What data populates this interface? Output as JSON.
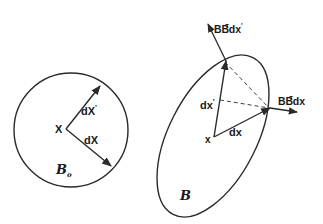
{
  "diagram": {
    "reference": {
      "region_label": "B",
      "region_subscript": "o",
      "point_label": "X",
      "vector_1_label": "dX",
      "vector_2_label": "dX",
      "vector_2_prime": "'"
    },
    "deformed": {
      "region_label": "B",
      "point_label": "x",
      "vector_1_label": "dx",
      "vector_2_label": "dx",
      "vector_2_prime": "'",
      "image_1_label_main": "BB",
      "image_1_label_sup": "T",
      "image_1_label_tail": "dx",
      "image_2_label_main": "BB",
      "image_2_label_sup": "T",
      "image_2_label_tail": "dx",
      "image_2_prime": "'"
    },
    "colors": {
      "line": "#2a2a2a",
      "background": "#ffffff"
    }
  }
}
